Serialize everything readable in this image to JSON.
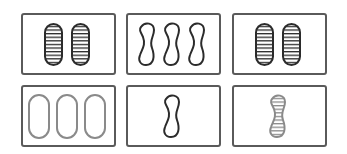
{
  "game": "set-card-board",
  "colors": {
    "dark": "#2b2b2b",
    "gray": "#8a8a8a",
    "card_border": "#5a5a5a"
  },
  "cards": [
    {
      "index": 0,
      "count": 2,
      "shape": "oval",
      "shading": "striped",
      "color": "dark"
    },
    {
      "index": 1,
      "count": 3,
      "shape": "squiggle",
      "shading": "outlined",
      "color": "dark"
    },
    {
      "index": 2,
      "count": 2,
      "shape": "oval",
      "shading": "striped",
      "color": "dark"
    },
    {
      "index": 3,
      "count": 3,
      "shape": "oval",
      "shading": "outlined",
      "color": "gray"
    },
    {
      "index": 4,
      "count": 1,
      "shape": "squiggle",
      "shading": "outlined",
      "color": "dark"
    },
    {
      "index": 5,
      "count": 1,
      "shape": "squiggle",
      "shading": "striped",
      "color": "gray"
    }
  ]
}
